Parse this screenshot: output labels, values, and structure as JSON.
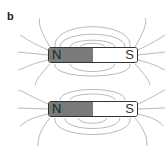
{
  "panel_label": "b",
  "magnets": [
    {
      "north_label": "N",
      "south_label": "S"
    },
    {
      "north_label": "N",
      "south_label": "S"
    }
  ],
  "colors": {
    "north": "#7a7a7a",
    "south": "#ffffff",
    "field_lines": "#888888"
  }
}
